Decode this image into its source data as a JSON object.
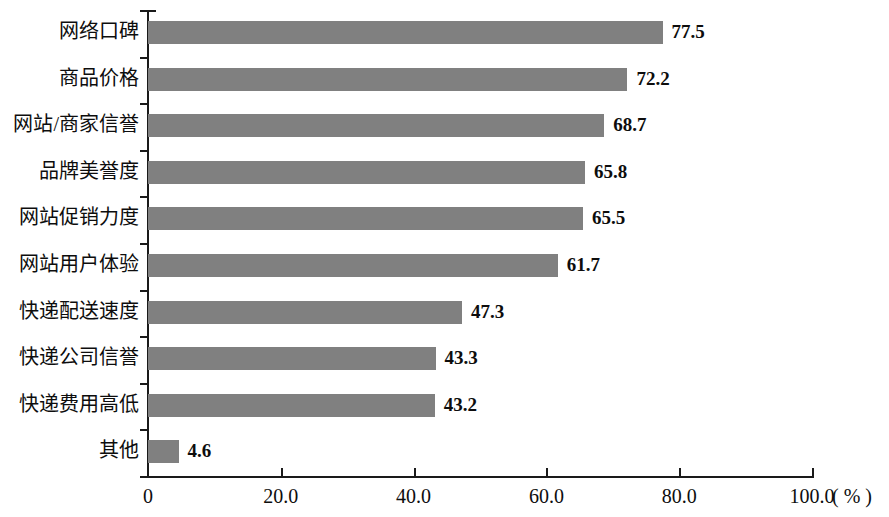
{
  "chart_data": {
    "type": "bar",
    "orientation": "horizontal",
    "title": "",
    "xlabel": "( % )",
    "ylabel": "",
    "categories": [
      "网络口碑",
      "商品价格",
      "网站/商家信誉",
      "品牌美誉度",
      "网站促销力度",
      "网站用户体验",
      "快递配送速度",
      "快递公司信誉",
      "快递费用高低",
      "其他"
    ],
    "values": [
      77.5,
      72.2,
      68.7,
      65.8,
      65.5,
      61.7,
      47.3,
      43.3,
      43.2,
      4.6
    ],
    "value_labels": [
      "77.5",
      "72.2",
      "68.7",
      "65.8",
      "65.5",
      "61.7",
      "47.3",
      "43.3",
      "43.2",
      "4.6"
    ],
    "xlim": [
      0,
      100
    ],
    "xticks": [
      0,
      20,
      40,
      60,
      80,
      100
    ],
    "xtick_labels": [
      "0",
      "20.0",
      "40.0",
      "60.0",
      "80.0",
      "100.0"
    ],
    "unit_label": "( % )",
    "grid": false,
    "legend": null,
    "bar_color": "#808080",
    "axis_color": "#1a1a1a",
    "text_color": "#0d0d0d",
    "background": "#ffffff"
  }
}
